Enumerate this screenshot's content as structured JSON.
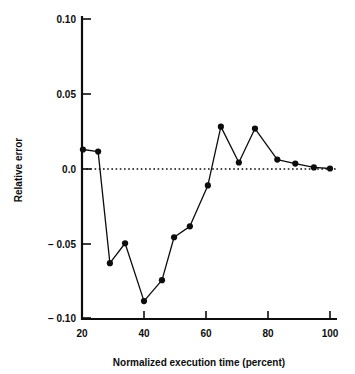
{
  "chart_data": {
    "type": "line",
    "title": "",
    "xlabel": "Normalized execution time (percent)",
    "ylabel": "Relative error",
    "xlim": [
      20,
      100
    ],
    "ylim": [
      -0.1,
      0.1
    ],
    "xticks": [
      20,
      40,
      60,
      80,
      100
    ],
    "xtick_labels": [
      "20",
      "40",
      "60",
      "80",
      "100"
    ],
    "yticks": [
      0.1,
      0.05,
      0.0,
      -0.05,
      -0.1
    ],
    "ytick_labels": [
      "0.10",
      "0.05",
      "0.0",
      "− 0.05",
      "− 0.10"
    ],
    "grid": false,
    "legend": "none",
    "reference_line": {
      "y": 0.0,
      "style": "dotted"
    },
    "marker": "filled-circle",
    "series": [
      {
        "name": "relative error",
        "x": [
          20.3,
          25.2,
          29.0,
          33.9,
          40.0,
          45.8,
          49.7,
          54.8,
          60.6,
          64.8,
          70.6,
          75.8,
          83.0,
          88.8,
          94.8,
          100.0
        ],
        "y": [
          0.0127,
          0.0113,
          -0.0633,
          -0.05,
          -0.0887,
          -0.0747,
          -0.046,
          -0.0387,
          -0.0113,
          0.028,
          0.004,
          0.0267,
          0.006,
          0.0033,
          0.0007,
          0.0
        ]
      }
    ]
  },
  "axes": {
    "ylabel_text": "Relative error",
    "xlabel_text": "Normalized execution time (percent)"
  }
}
